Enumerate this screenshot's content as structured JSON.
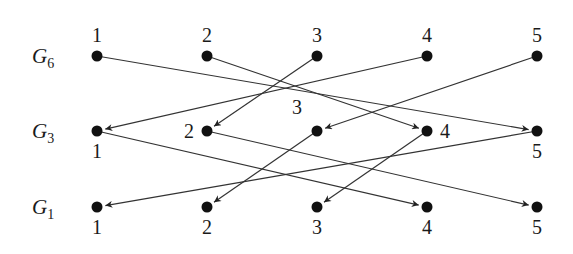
{
  "diagram": {
    "rows": [
      {
        "id": "G6",
        "label_base": "G",
        "label_sub": "6",
        "node_labels": [
          "1",
          "2",
          "3",
          "4",
          "5"
        ],
        "label_placement": [
          "above",
          "above",
          "above",
          "above",
          "above"
        ]
      },
      {
        "id": "G3",
        "label_base": "G",
        "label_sub": "3",
        "node_labels": [
          "1",
          "2",
          "3",
          "4",
          "5"
        ],
        "label_placement": [
          "below",
          "left",
          "above-left",
          "right",
          "below"
        ]
      },
      {
        "id": "G1",
        "label_base": "G",
        "label_sub": "1",
        "node_labels": [
          "1",
          "2",
          "3",
          "4",
          "5"
        ],
        "label_placement": [
          "below",
          "below",
          "below",
          "below",
          "below"
        ]
      }
    ],
    "edges": [
      {
        "from": [
          "G6",
          1
        ],
        "to": [
          "G3",
          5
        ]
      },
      {
        "from": [
          "G6",
          2
        ],
        "to": [
          "G3",
          4
        ]
      },
      {
        "from": [
          "G6",
          3
        ],
        "to": [
          "G3",
          2
        ]
      },
      {
        "from": [
          "G6",
          4
        ],
        "to": [
          "G3",
          1
        ]
      },
      {
        "from": [
          "G6",
          5
        ],
        "to": [
          "G3",
          3
        ]
      },
      {
        "from": [
          "G3",
          1
        ],
        "to": [
          "G1",
          4
        ]
      },
      {
        "from": [
          "G3",
          2
        ],
        "to": [
          "G1",
          5
        ]
      },
      {
        "from": [
          "G3",
          3
        ],
        "to": [
          "G1",
          2
        ]
      },
      {
        "from": [
          "G3",
          4
        ],
        "to": [
          "G1",
          3
        ]
      },
      {
        "from": [
          "G3",
          5
        ],
        "to": [
          "G1",
          1
        ]
      }
    ],
    "colors": {
      "node": "#111111",
      "edge": "#333333",
      "text": "#1a1a1a"
    }
  }
}
